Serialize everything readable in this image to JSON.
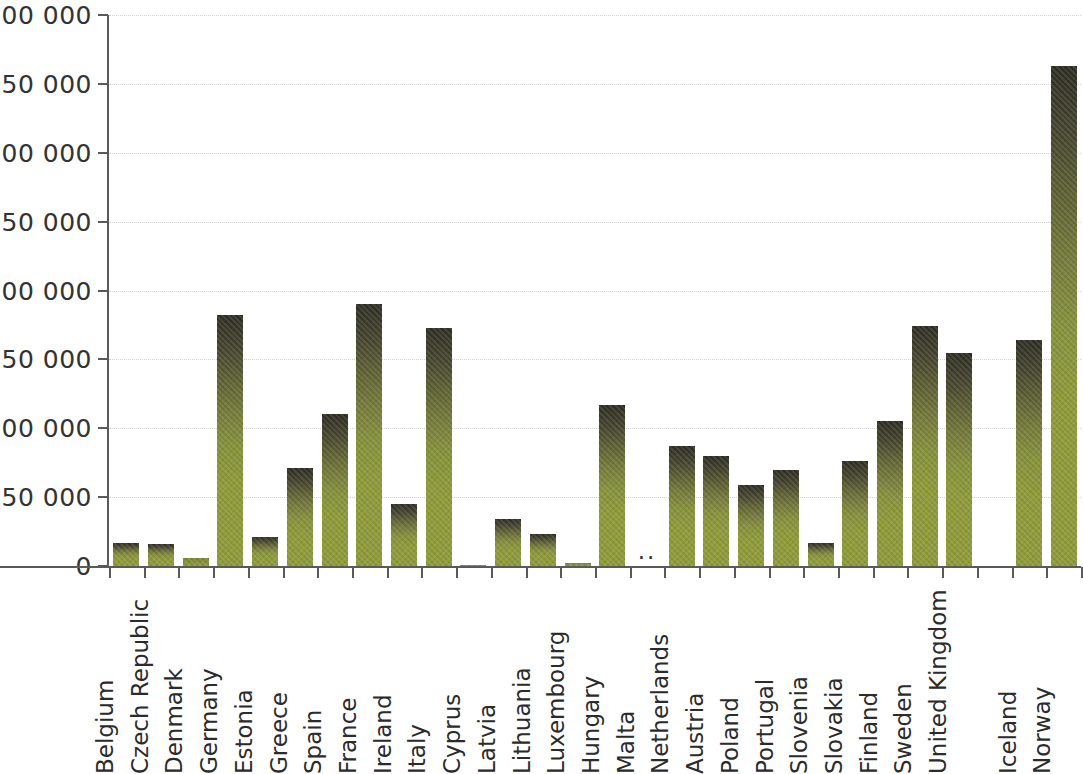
{
  "chart_data": {
    "type": "bar",
    "title": "",
    "subtitle": "",
    "xlabel": "",
    "ylabel": "",
    "ylim": [
      0,
      400000
    ],
    "grid": true,
    "legend": null,
    "y_ticks": [
      0,
      50000,
      100000,
      150000,
      200000,
      250000,
      300000,
      350000,
      400000
    ],
    "y_tick_labels": [
      "0",
      "50 000",
      "100 000",
      "150 000",
      "200 000",
      "250 000",
      "300 000",
      "350 000",
      "400 000"
    ],
    "not_available_marker": "..",
    "categories": [
      "Belgium",
      "Czech Republic",
      "Denmark",
      "Germany",
      "Estonia",
      "Greece",
      "Spain",
      "France",
      "Ireland",
      "Italy",
      "Cyprus",
      "Latvia",
      "Lithuania",
      "Luxembourg",
      "Hungary",
      "Malta",
      "Netherlands",
      "Austria",
      "Poland",
      "Portugal",
      "Slovenia",
      "Slovakia",
      "Finland",
      "Sweden",
      "United Kingdom",
      "",
      "Iceland",
      "Norway"
    ],
    "values": [
      17000,
      16000,
      6000,
      182000,
      21000,
      71000,
      110000,
      190000,
      45000,
      173000,
      1000,
      34000,
      23000,
      2000,
      117000,
      null,
      87000,
      80000,
      59000,
      70000,
      17000,
      76000,
      105000,
      174000,
      155000,
      null,
      164000,
      363000
    ],
    "series_name": "",
    "bar_color_top": "#2e2d22",
    "bar_color_bottom": "#8d9a37",
    "axis_color": "#5a5a5a",
    "gridline_color": "#c9c9c9",
    "background": "#ffffff"
  }
}
